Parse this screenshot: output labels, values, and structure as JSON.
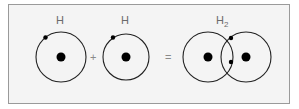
{
  "diagram": {
    "atom1": {
      "label": "H"
    },
    "plus": "+",
    "atom2": {
      "label": "H"
    },
    "equals": "=",
    "molecule": {
      "label_main": "H",
      "label_sub": "2"
    }
  },
  "colors": {
    "border": "#9a9a9a",
    "background": "#f4f4f4",
    "stroke": "#222222",
    "label": "#6a6a6a"
  }
}
